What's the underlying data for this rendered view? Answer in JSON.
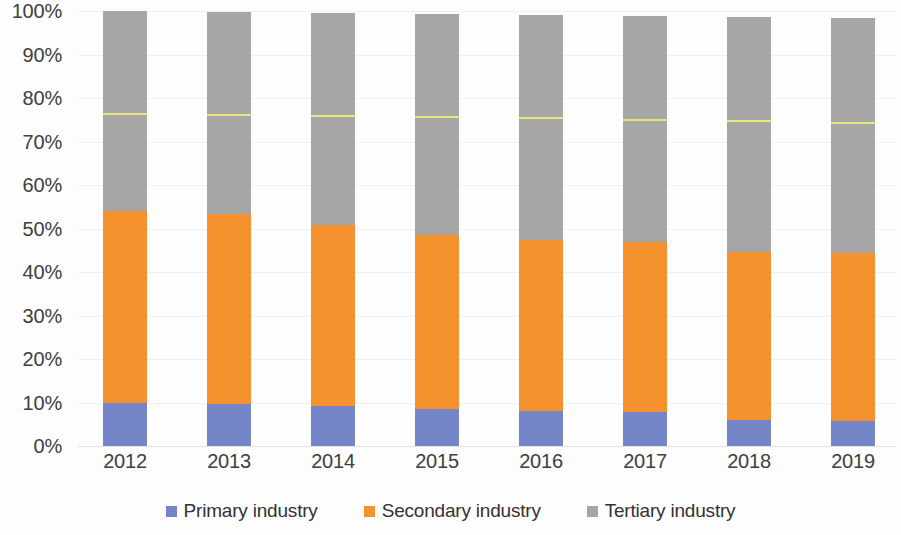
{
  "chart_data": {
    "type": "bar",
    "subtype": "stacked-percent",
    "title": "",
    "subtitle": "",
    "xlabel": "",
    "ylabel": "",
    "categories": [
      "2012",
      "2013",
      "2014",
      "2015",
      "2016",
      "2017",
      "2018",
      "2019"
    ],
    "series": [
      {
        "name": "Primary industry",
        "color": "#7384c7",
        "values": [
          9.9,
          9.7,
          9.2,
          8.5,
          8.0,
          7.8,
          6.0,
          5.7
        ]
      },
      {
        "name": "Secondary industry",
        "color": "#f5922e",
        "values": [
          44.1,
          43.6,
          41.6,
          40.0,
          39.4,
          39.1,
          38.6,
          38.7
        ]
      },
      {
        "name": "Tertiary industry",
        "color": "#a6a6a6",
        "values": [
          46.0,
          46.5,
          48.8,
          50.9,
          51.6,
          51.9,
          54.0,
          54.1
        ]
      }
    ],
    "totals": [
      100.0,
      99.8,
      99.6,
      99.4,
      99.0,
      98.8,
      98.6,
      98.5
    ],
    "marker_line": {
      "name": "reference-line",
      "color": "#e6e67a",
      "values": [
        76.1,
        75.9,
        75.7,
        75.4,
        75.1,
        74.8,
        74.4,
        74.1
      ]
    },
    "ylim": [
      0,
      100
    ],
    "ytick_values": [
      0,
      10,
      20,
      30,
      40,
      50,
      60,
      70,
      80,
      90,
      100
    ],
    "ytick_labels": [
      "0%",
      "10%",
      "20%",
      "30%",
      "40%",
      "50%",
      "60%",
      "70%",
      "80%",
      "90%",
      "100%"
    ],
    "grid": true,
    "legend_position": "bottom"
  },
  "y_axis": {
    "ticks": [
      {
        "label": "100%",
        "value": 100
      },
      {
        "label": "90%",
        "value": 90
      },
      {
        "label": "80%",
        "value": 80
      },
      {
        "label": "70%",
        "value": 70
      },
      {
        "label": "60%",
        "value": 60
      },
      {
        "label": "50%",
        "value": 50
      },
      {
        "label": "40%",
        "value": 40
      },
      {
        "label": "30%",
        "value": 30
      },
      {
        "label": "20%",
        "value": 20
      },
      {
        "label": "10%",
        "value": 10
      },
      {
        "label": "0%",
        "value": 0
      }
    ]
  },
  "x_axis": {
    "ticks": [
      {
        "label": "2012"
      },
      {
        "label": "2013"
      },
      {
        "label": "2014"
      },
      {
        "label": "2015"
      },
      {
        "label": "2016"
      },
      {
        "label": "2017"
      },
      {
        "label": "2018"
      },
      {
        "label": "2019"
      }
    ]
  },
  "legend": {
    "items": [
      {
        "label": "Primary industry",
        "color": "#7384c7"
      },
      {
        "label": "Secondary industry",
        "color": "#f5922e"
      },
      {
        "label": "Tertiary industry",
        "color": "#a6a6a6"
      }
    ]
  }
}
